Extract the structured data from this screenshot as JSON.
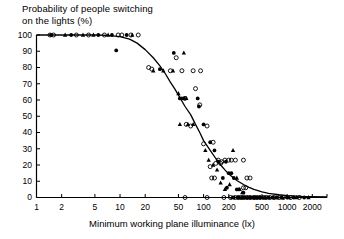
{
  "chart_data": {
    "type": "scatter",
    "title": "Probability of people switching\non the lights (%)",
    "title_line1": "Probability of people switching",
    "title_line2": "on the lights (%)",
    "xlabel": "Minimum working plane illuminance (lx)",
    "ylabel": "Probability of people switching on the lights (%)",
    "xscale": "log",
    "yscale": "linear",
    "xlim": [
      1,
      3000
    ],
    "ylim": [
      0,
      100
    ],
    "grid": false,
    "legend": "none",
    "xticks": [
      1,
      2,
      5,
      10,
      20,
      50,
      100,
      200,
      500,
      1000,
      2000
    ],
    "xticklabels": [
      "1",
      "2",
      "5",
      "10",
      "20",
      "50",
      "100",
      "200",
      "500",
      "1000",
      "2000"
    ],
    "yticks": [
      0,
      10,
      20,
      30,
      40,
      50,
      60,
      70,
      80,
      90,
      100
    ],
    "yticklabels": [
      "0",
      "10",
      "20",
      "30",
      "40",
      "50",
      "60",
      "70",
      "80",
      "90",
      "100"
    ],
    "fit_curve": {
      "name": "logistic fit",
      "description": "Sigmoid decline from 100% below 10 lx through 50% near 90 lx to near 0% above 500 lx",
      "points": [
        [
          1,
          100
        ],
        [
          2,
          100
        ],
        [
          3,
          100
        ],
        [
          5,
          100
        ],
        [
          7,
          99.8
        ],
        [
          10,
          99
        ],
        [
          13,
          97.5
        ],
        [
          16,
          95
        ],
        [
          20,
          91
        ],
        [
          25,
          86
        ],
        [
          30,
          81
        ],
        [
          35,
          76
        ],
        [
          40,
          71
        ],
        [
          45,
          67
        ],
        [
          50,
          63
        ],
        [
          60,
          56
        ],
        [
          70,
          51
        ],
        [
          80,
          45
        ],
        [
          90,
          40
        ],
        [
          100,
          35
        ],
        [
          120,
          29
        ],
        [
          140,
          24
        ],
        [
          160,
          20
        ],
        [
          180,
          17
        ],
        [
          200,
          14.5
        ],
        [
          250,
          10.5
        ],
        [
          300,
          8
        ],
        [
          350,
          6.2
        ],
        [
          400,
          5
        ],
        [
          500,
          3.5
        ],
        [
          600,
          2.6
        ],
        [
          800,
          1.7
        ],
        [
          1000,
          1.2
        ],
        [
          1500,
          0.7
        ],
        [
          2000,
          0.5
        ],
        [
          3000,
          0.3
        ]
      ]
    },
    "series": [
      {
        "name": "open circle",
        "marker": "open-circle",
        "points": [
          [
            1.45,
            100
          ],
          [
            1.6,
            100
          ],
          [
            3.0,
            100
          ],
          [
            4.2,
            100
          ],
          [
            6.5,
            100
          ],
          [
            9.5,
            100
          ],
          [
            10.5,
            100
          ],
          [
            13.5,
            100
          ],
          [
            16.5,
            100
          ],
          [
            22,
            80
          ],
          [
            24,
            79
          ],
          [
            40,
            78
          ],
          [
            47,
            86
          ],
          [
            55,
            78
          ],
          [
            60,
            61
          ],
          [
            75,
            78
          ],
          [
            92,
            78
          ],
          [
            80,
            67
          ],
          [
            90,
            57
          ],
          [
            62,
            45
          ],
          [
            70,
            44
          ],
          [
            100,
            33
          ],
          [
            110,
            44
          ],
          [
            130,
            34
          ],
          [
            150,
            23
          ],
          [
            165,
            22
          ],
          [
            180,
            23
          ],
          [
            200,
            23
          ],
          [
            215,
            23
          ],
          [
            240,
            23
          ],
          [
            300,
            23
          ],
          [
            140,
            21
          ],
          [
            160,
            21
          ],
          [
            120,
            19
          ],
          [
            125,
            12
          ],
          [
            135,
            12
          ],
          [
            330,
            12
          ],
          [
            360,
            12
          ],
          [
            300,
            6
          ],
          [
            320,
            6
          ],
          [
            60,
            0
          ],
          [
            110,
            0
          ],
          [
            175,
            0
          ],
          [
            210,
            0
          ],
          [
            240,
            0
          ],
          [
            260,
            0
          ],
          [
            280,
            0
          ],
          [
            300,
            0
          ],
          [
            330,
            0
          ],
          [
            360,
            0
          ],
          [
            400,
            0
          ],
          [
            430,
            0
          ],
          [
            470,
            0
          ],
          [
            520,
            0
          ],
          [
            560,
            0
          ],
          [
            620,
            0
          ],
          [
            700,
            0
          ],
          [
            800,
            0
          ],
          [
            900,
            0
          ],
          [
            1100,
            0
          ],
          [
            1400,
            0
          ]
        ]
      },
      {
        "name": "filled circle",
        "marker": "filled-circle",
        "points": [
          [
            1.5,
            100
          ],
          [
            2.6,
            100
          ],
          [
            5.5,
            100
          ],
          [
            8.0,
            100
          ],
          [
            12,
            100
          ],
          [
            9.0,
            90.5
          ],
          [
            30,
            79
          ],
          [
            44,
            89
          ],
          [
            52,
            61
          ],
          [
            58,
            61
          ],
          [
            85,
            61
          ],
          [
            88,
            56
          ],
          [
            100,
            45
          ],
          [
            120,
            34
          ],
          [
            135,
            29
          ],
          [
            150,
            22
          ],
          [
            185,
            22
          ],
          [
            200,
            15
          ],
          [
            215,
            15
          ],
          [
            230,
            12
          ],
          [
            170,
            12
          ],
          [
            190,
            6
          ],
          [
            250,
            5
          ],
          [
            265,
            5
          ],
          [
            300,
            3
          ],
          [
            230,
            0
          ],
          [
            260,
            0
          ],
          [
            290,
            0
          ],
          [
            310,
            0
          ],
          [
            340,
            0
          ],
          [
            370,
            0
          ],
          [
            400,
            0
          ],
          [
            440,
            0
          ],
          [
            480,
            0
          ],
          [
            540,
            0
          ],
          [
            600,
            0
          ],
          [
            680,
            0
          ],
          [
            760,
            0
          ],
          [
            850,
            0
          ],
          [
            1000,
            0
          ],
          [
            1200,
            0
          ],
          [
            1600,
            0
          ]
        ]
      },
      {
        "name": "filled triangle",
        "marker": "filled-triangle",
        "points": [
          [
            2.2,
            100
          ],
          [
            3.6,
            100
          ],
          [
            4.8,
            100
          ],
          [
            7.2,
            100
          ],
          [
            14,
            100
          ],
          [
            25,
            78
          ],
          [
            33,
            78
          ],
          [
            43,
            78
          ],
          [
            58,
            89
          ],
          [
            50,
            64
          ],
          [
            55,
            61
          ],
          [
            62,
            61
          ],
          [
            52,
            45
          ],
          [
            65,
            45
          ],
          [
            75,
            45
          ],
          [
            105,
            29
          ],
          [
            115,
            23
          ],
          [
            130,
            20
          ],
          [
            145,
            17
          ],
          [
            160,
            9
          ],
          [
            180,
            5
          ],
          [
            205,
            8
          ],
          [
            225,
            29
          ],
          [
            250,
            12
          ],
          [
            270,
            5
          ],
          [
            290,
            3
          ],
          [
            220,
            0
          ],
          [
            270,
            0
          ],
          [
            320,
            0
          ],
          [
            350,
            0
          ],
          [
            390,
            0
          ],
          [
            420,
            0
          ],
          [
            460,
            0
          ],
          [
            500,
            0
          ],
          [
            580,
            0
          ],
          [
            660,
            0
          ],
          [
            740,
            0
          ],
          [
            880,
            0
          ],
          [
            1050,
            0
          ],
          [
            1300,
            0
          ],
          [
            1800,
            0
          ]
        ]
      }
    ]
  }
}
